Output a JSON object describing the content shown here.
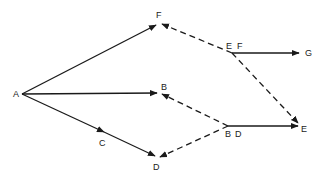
{
  "diagram": {
    "type": "activity-network",
    "nodes": [
      {
        "id": "A",
        "label": "A"
      },
      {
        "id": "F",
        "label": "F"
      },
      {
        "id": "B",
        "label": "B"
      },
      {
        "id": "C",
        "label": "C"
      },
      {
        "id": "D",
        "label": "D"
      },
      {
        "id": "EF",
        "label_1": "E",
        "label_2": "F"
      },
      {
        "id": "G",
        "label": "G"
      },
      {
        "id": "BD",
        "label_1": "B",
        "label_2": "D"
      },
      {
        "id": "E",
        "label": "E"
      }
    ],
    "edges": [
      {
        "from": "A",
        "to": "F",
        "style": "solid"
      },
      {
        "from": "A",
        "to": "B",
        "style": "solid"
      },
      {
        "from": "A",
        "to": "D",
        "style": "solid",
        "via": "C"
      },
      {
        "from": "EF",
        "to": "F",
        "style": "dashed"
      },
      {
        "from": "EF",
        "to": "G",
        "style": "solid"
      },
      {
        "from": "EF",
        "to": "E",
        "style": "dashed"
      },
      {
        "from": "BD",
        "to": "B",
        "style": "dashed"
      },
      {
        "from": "BD",
        "to": "D",
        "style": "dashed"
      },
      {
        "from": "BD",
        "to": "E",
        "style": "solid"
      }
    ]
  },
  "labels": {
    "A": "A",
    "F": "F",
    "B": "B",
    "C": "C",
    "D": "D",
    "EF_E": "E",
    "EF_F": "F",
    "G": "G",
    "BD_B": "B",
    "BD_D": "D",
    "E": "E"
  }
}
